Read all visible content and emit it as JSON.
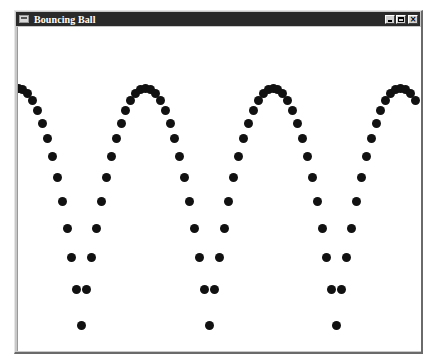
{
  "window": {
    "title": "Bouncing Ball",
    "controls": {
      "minimize": "minimize",
      "maximize": "maximize",
      "close": "×"
    }
  },
  "colors": {
    "titlebar": "#2a2a2a",
    "ball": "#111111",
    "canvas": "#ffffff"
  },
  "animation": {
    "description": "Trail of ball positions sampled at uniform time steps",
    "ball_diameter_px": 9,
    "peak_y": 88,
    "floor_y": 325,
    "period_px": 127.5,
    "steps_per_period": 26,
    "peaks_x": [
      17,
      145,
      272,
      400
    ],
    "bottoms_x": [
      81,
      208,
      336
    ],
    "dots": []
  }
}
